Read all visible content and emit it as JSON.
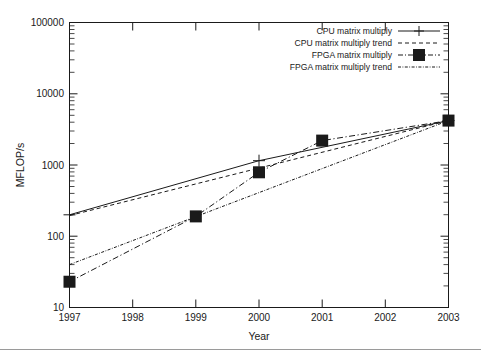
{
  "chart_data": {
    "type": "line",
    "title": "",
    "xlabel": "Year",
    "ylabel": "MFLOP/s",
    "xlim": [
      1997,
      2003
    ],
    "ylim": [
      10,
      100000
    ],
    "yscale": "log",
    "grid": false,
    "legend_position": "top-right",
    "x_ticks": [
      "1997",
      "1998",
      "1999",
      "2000",
      "2001",
      "2002",
      "2003"
    ],
    "y_ticks": [
      "10",
      "100",
      "1000",
      "10000",
      "100000"
    ],
    "series": [
      {
        "name": "CPU matrix multiply",
        "style": "solid",
        "marker": "cross",
        "x": [
          1997,
          2000,
          2003
        ],
        "values": [
          200,
          1150,
          4200
        ]
      },
      {
        "name": "CPU matrix multiply trend",
        "style": "dashed",
        "marker": "none",
        "x": [
          1997,
          2003
        ],
        "values": [
          195,
          4200
        ]
      },
      {
        "name": "FPGA matrix multiply",
        "style": "dash-dot",
        "marker": "filled-square",
        "x": [
          1997,
          1999,
          2000,
          2001,
          2003
        ],
        "values": [
          23,
          190,
          790,
          2200,
          4200
        ]
      },
      {
        "name": "FPGA matrix multiply trend",
        "style": "fine-dash-dot",
        "marker": "none",
        "x": [
          1997,
          2003
        ],
        "values": [
          40,
          4200
        ]
      }
    ]
  },
  "figure": {
    "axis_x_title": "Year",
    "axis_y_title": "MFLOP/s"
  },
  "legend": {
    "entries": [
      {
        "label": "CPU matrix multiply"
      },
      {
        "label": "CPU matrix multiply trend"
      },
      {
        "label": "FPGA matrix multiply"
      },
      {
        "label": "FPGA matrix multiply trend"
      }
    ]
  },
  "colors": {
    "ink": "#1a1a1a",
    "background": "#ffffff",
    "footer_rule": "#9a9a9a"
  }
}
